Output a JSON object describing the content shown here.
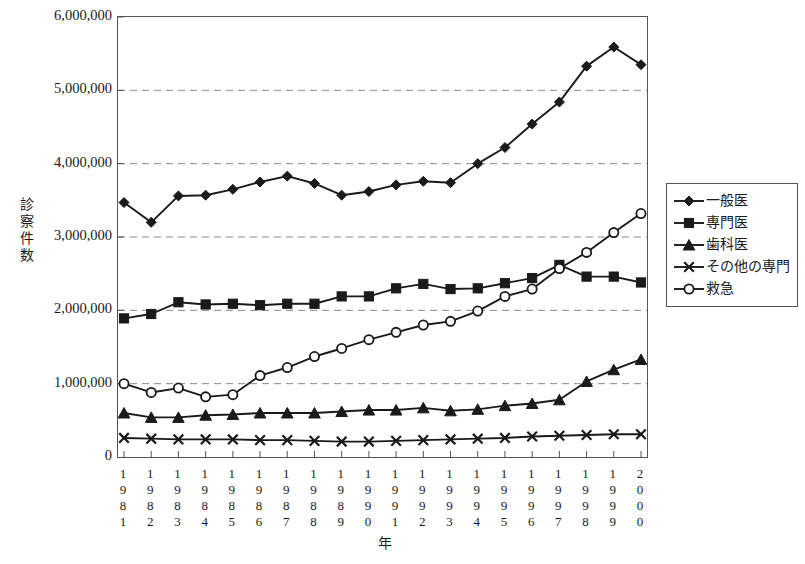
{
  "chart_data": {
    "type": "line",
    "title": "",
    "xlabel": "年",
    "ylabel": "診察件数",
    "ylim": [
      0,
      6000000
    ],
    "ytick_values": [
      0,
      1000000,
      2000000,
      3000000,
      4000000,
      5000000,
      6000000
    ],
    "ytick_labels": [
      "0",
      "1,000,000",
      "2,000,000",
      "3,000,000",
      "4,000,000",
      "5,000,000",
      "6,000,000"
    ],
    "grid": "horizontal-dashed",
    "legend_position": "right",
    "x": [
      1981,
      1982,
      1983,
      1984,
      1985,
      1986,
      1987,
      1988,
      1989,
      1990,
      1991,
      1992,
      1993,
      1994,
      1995,
      1996,
      1997,
      1998,
      1999,
      2000
    ],
    "xtick_labels": [
      "1981",
      "1982",
      "1983",
      "1984",
      "1985",
      "1986",
      "1987",
      "1988",
      "1989",
      "1990",
      "1991",
      "1992",
      "1993",
      "1994",
      "1995",
      "1996",
      "1997",
      "1998",
      "1999",
      "2000"
    ],
    "series": [
      {
        "name": "一般医",
        "marker": "diamond",
        "values": [
          3470000,
          3200000,
          3560000,
          3570000,
          3650000,
          3750000,
          3830000,
          3730000,
          3570000,
          3620000,
          3710000,
          3760000,
          3740000,
          4000000,
          4220000,
          4540000,
          4840000,
          5330000,
          5590000,
          5350000
        ]
      },
      {
        "name": "専門医",
        "marker": "square",
        "values": [
          1890000,
          1950000,
          2110000,
          2080000,
          2090000,
          2070000,
          2090000,
          2090000,
          2190000,
          2190000,
          2300000,
          2360000,
          2290000,
          2300000,
          2370000,
          2440000,
          2620000,
          2460000,
          2460000,
          2380000
        ]
      },
      {
        "name": "歯科医",
        "marker": "triangle",
        "values": [
          600000,
          540000,
          540000,
          570000,
          580000,
          600000,
          600000,
          600000,
          620000,
          640000,
          640000,
          670000,
          630000,
          650000,
          700000,
          730000,
          780000,
          1030000,
          1190000,
          1330000
        ]
      },
      {
        "name": "その他の専門",
        "marker": "x",
        "values": [
          260000,
          250000,
          240000,
          240000,
          240000,
          230000,
          230000,
          220000,
          210000,
          210000,
          220000,
          230000,
          240000,
          250000,
          260000,
          280000,
          290000,
          300000,
          310000,
          310000
        ]
      },
      {
        "name": "救急",
        "marker": "circle",
        "values": [
          1000000,
          880000,
          940000,
          820000,
          850000,
          1110000,
          1220000,
          1370000,
          1480000,
          1600000,
          1700000,
          1800000,
          1850000,
          1990000,
          2190000,
          2290000,
          2570000,
          2790000,
          3060000,
          3320000
        ]
      }
    ]
  },
  "legend": {
    "items": [
      {
        "label": "一般医",
        "marker": "diamond"
      },
      {
        "label": "専門医",
        "marker": "square"
      },
      {
        "label": "歯科医",
        "marker": "triangle"
      },
      {
        "label": "その他の専門",
        "marker": "x"
      },
      {
        "label": "救急",
        "marker": "circle"
      }
    ]
  },
  "axes": {
    "y_title": "診察件数",
    "x_title": "年"
  },
  "colors": {
    "line": "#1a1a1a",
    "grid": "#8a8a8a",
    "frame": "#555555",
    "background": "#ffffff"
  }
}
